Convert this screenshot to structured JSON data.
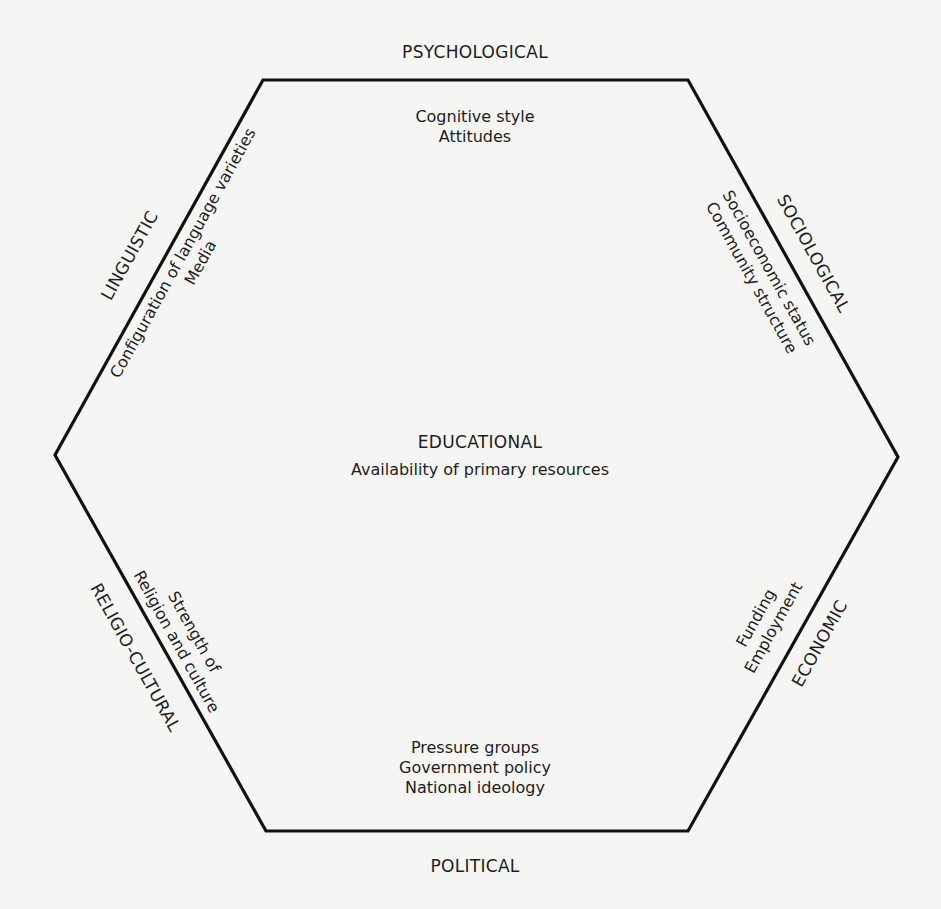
{
  "diagram": {
    "type": "hexagon-factor-model",
    "stroke_color": "#111111",
    "background_color": "#f5f5f3",
    "vertices": [
      [
        263,
        80
      ],
      [
        688,
        80
      ],
      [
        898,
        457
      ],
      [
        688,
        831
      ],
      [
        266,
        831
      ],
      [
        55,
        455
      ]
    ],
    "center": {
      "heading": "EDUCATIONAL",
      "items": [
        "Availability of primary resources"
      ]
    },
    "factors": {
      "psychological": {
        "heading": "PSYCHOLOGICAL",
        "items": [
          "Cognitive style",
          "Attitudes"
        ]
      },
      "sociological": {
        "heading": "SOCIOLOGICAL",
        "items": [
          "Socioeconomic status",
          "Community structure"
        ]
      },
      "economic": {
        "heading": "ECONOMIC",
        "items": [
          "Funding",
          "Employment"
        ]
      },
      "political": {
        "heading": "POLITICAL",
        "items": [
          "Pressure groups",
          "Government policy",
          "National ideology"
        ]
      },
      "religio_cultural": {
        "heading": "RELIGIO-CULTURAL",
        "items": [
          "Strength of",
          "Religion and culture"
        ]
      },
      "linguistic": {
        "heading": "LINGUISTIC",
        "items": [
          "Configuration of language varieties",
          "Media"
        ]
      }
    }
  }
}
